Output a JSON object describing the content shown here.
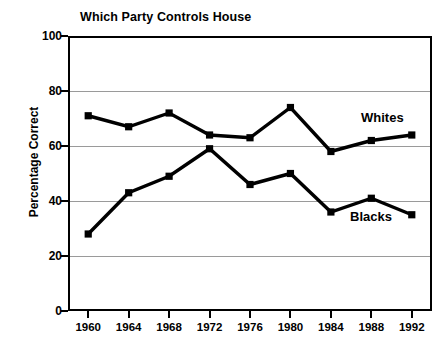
{
  "chart_data": {
    "type": "line",
    "title": "Which Party Controls House",
    "xlabel": "",
    "ylabel": "Percentage Correct",
    "categories": [
      "1960",
      "1964",
      "1968",
      "1972",
      "1976",
      "1980",
      "1984",
      "1988",
      "1992"
    ],
    "x": [
      1960,
      1964,
      1968,
      1972,
      1976,
      1980,
      1984,
      1988,
      1992
    ],
    "ylim": [
      0,
      100
    ],
    "yticks": [
      "0",
      "20",
      "40",
      "60",
      "80",
      "100"
    ],
    "ytick_values": [
      0,
      20,
      40,
      60,
      80,
      100
    ],
    "grid": true,
    "legend_position": "inline-series-labels",
    "marker": "square",
    "series": [
      {
        "name": "Whites",
        "values": [
          71,
          67,
          72,
          64,
          63,
          74,
          58,
          62,
          64
        ],
        "color": "#000000"
      },
      {
        "name": "Blacks",
        "values": [
          28,
          43,
          49,
          59,
          46,
          50,
          36,
          41,
          35
        ],
        "color": "#000000"
      }
    ]
  },
  "colors": {
    "line": "#000000",
    "grid": "#9a9a9a",
    "axis": "#000000",
    "background": "#ffffff"
  }
}
